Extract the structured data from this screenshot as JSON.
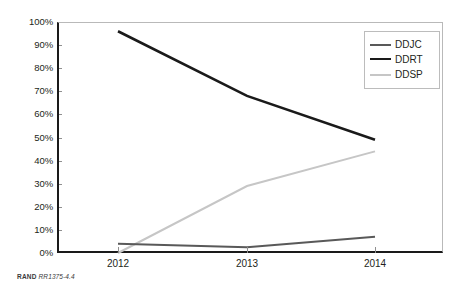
{
  "figure": {
    "credit_org": "RAND",
    "credit_id": "RR1375-4.4"
  },
  "legend": {
    "position": "top-right-inside",
    "items": [
      {
        "label": "DDJC",
        "color": "#595959",
        "width": 2.0
      },
      {
        "label": "DDRT",
        "color": "#1a1a1a",
        "width": 2.6
      },
      {
        "label": "DDSP",
        "color": "#c6c6c6",
        "width": 2.0
      }
    ]
  },
  "axes": {
    "x_ticks": [
      "2012",
      "2013",
      "2014"
    ],
    "y_ticks": [
      "0%",
      "10%",
      "20%",
      "30%",
      "40%",
      "50%",
      "60%",
      "70%",
      "80%",
      "90%",
      "100%"
    ]
  },
  "chart_data": {
    "type": "line",
    "title": "",
    "subtitle": "",
    "xlabel": "",
    "ylabel": "",
    "categories": [
      "2012",
      "2013",
      "2014"
    ],
    "x": [
      2012,
      2013,
      2014
    ],
    "ylim": [
      0,
      100
    ],
    "y_tick_step": 10,
    "y_unit": "%",
    "grid": false,
    "legend_position": "top-right-inside",
    "series": [
      {
        "name": "DDJC",
        "values": [
          4,
          2.5,
          7
        ],
        "color": "#595959",
        "line_width": 2.0
      },
      {
        "name": "DDRT",
        "values": [
          96,
          68,
          49
        ],
        "color": "#1a1a1a",
        "line_width": 2.6
      },
      {
        "name": "DDSP",
        "values": [
          0,
          29,
          44
        ],
        "color": "#c6c6c6",
        "line_width": 2.0
      }
    ],
    "annotations": [
      "RAND RR1375-4.4"
    ]
  }
}
